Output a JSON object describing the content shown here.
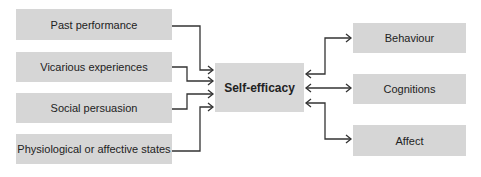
{
  "diagram": {
    "inputs": [
      {
        "label": "Past performance"
      },
      {
        "label": "Vicarious experiences"
      },
      {
        "label": "Social persuasion"
      },
      {
        "label": "Physiological or affective states"
      }
    ],
    "center": {
      "label": "Self-efficacy"
    },
    "outputs": [
      {
        "label": "Behaviour"
      },
      {
        "label": "Cognitions"
      },
      {
        "label": "Affect"
      }
    ],
    "colors": {
      "box_fill": "#d6d6d6",
      "line": "#333333"
    }
  }
}
